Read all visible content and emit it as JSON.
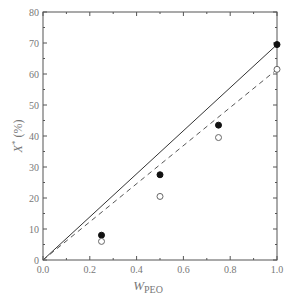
{
  "chart_data": {
    "type": "scatter",
    "title": "",
    "xlabel": "W_PEO",
    "xlabel_main": "W",
    "xlabel_sub": "PEO",
    "ylabel": "X* (%)",
    "ylabel_main": "X",
    "ylabel_sup": "*",
    "ylabel_unit": "(%)",
    "xlim": [
      0.0,
      1.0
    ],
    "ylim": [
      0,
      80
    ],
    "xticks": [
      "0.0",
      "0.2",
      "0.4",
      "0.6",
      "0.8",
      "1.0"
    ],
    "yticks": [
      "0",
      "10",
      "20",
      "30",
      "40",
      "50",
      "60",
      "70",
      "80"
    ],
    "grid": false,
    "legend": null,
    "series": [
      {
        "name": "filled circles",
        "marker": "filled-circle",
        "x": [
          0.25,
          0.5,
          0.75,
          1.0
        ],
        "y": [
          8,
          27.5,
          43.5,
          69.5
        ]
      },
      {
        "name": "open circles",
        "marker": "open-circle",
        "x": [
          0.25,
          0.5,
          0.75,
          1.0
        ],
        "y": [
          6,
          20.5,
          39.5,
          61.5
        ]
      },
      {
        "name": "solid line",
        "style": "solid",
        "x": [
          0.0,
          1.0
        ],
        "y": [
          0,
          69.5
        ]
      },
      {
        "name": "dashed line",
        "style": "dashed",
        "x": [
          0.0,
          1.0
        ],
        "y": [
          0,
          61.5
        ]
      }
    ]
  }
}
